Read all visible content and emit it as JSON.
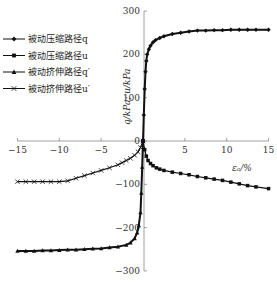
{
  "chart_data": {
    "type": "line",
    "title": "",
    "xlabel": "εₐ/%",
    "ylabel": "q/kPa; u/kPa",
    "xlim": [
      -15,
      15
    ],
    "ylim": [
      -300,
      300
    ],
    "xticks": [
      -15,
      -10,
      -5,
      0,
      5,
      10,
      15
    ],
    "yticks": [
      -300,
      -200,
      -100,
      0,
      100,
      200,
      300
    ],
    "grid": false,
    "legend_position": "upper-left",
    "series": [
      {
        "name": "被动压缩路径q",
        "marker": "diamond",
        "x": [
          0,
          0.1,
          0.2,
          0.3,
          0.4,
          0.5,
          0.7,
          0.9,
          1.2,
          1.5,
          2,
          2.5,
          3.5,
          4.5,
          5.5,
          6.5,
          7.5,
          8.5,
          9.5,
          10.5,
          11.5,
          12.5,
          13.5,
          15
        ],
        "y": [
          0,
          60,
          120,
          160,
          185,
          200,
          212,
          220,
          228,
          233,
          238,
          242,
          247,
          250,
          253,
          255,
          255,
          256,
          256,
          257,
          257,
          257,
          257,
          257
        ]
      },
      {
        "name": "被动压缩路径u",
        "marker": "square",
        "x": [
          0,
          0.2,
          0.4,
          0.6,
          0.9,
          1.2,
          1.6,
          2,
          2.5,
          3.5,
          4.5,
          5.5,
          6.5,
          7.5,
          8.5,
          9.5,
          10.5,
          11.5,
          12.5,
          13.5,
          15
        ],
        "y": [
          0,
          -20,
          -35,
          -45,
          -52,
          -57,
          -62,
          -65,
          -68,
          -72,
          -75,
          -78,
          -82,
          -85,
          -88,
          -91,
          -95,
          -99,
          -103,
          -106,
          -110
        ]
      },
      {
        "name": "被动挤伸路径q′",
        "marker": "triangle",
        "x": [
          0,
          -0.1,
          -0.2,
          -0.3,
          -0.5,
          -0.7,
          -1,
          -1.5,
          -2,
          -3,
          -4,
          -5,
          -6,
          -7,
          -8,
          -9,
          -10,
          -11,
          -12,
          -13,
          -14,
          -15
        ],
        "y": [
          0,
          -60,
          -120,
          -165,
          -195,
          -212,
          -225,
          -235,
          -240,
          -244,
          -246,
          -248,
          -249,
          -250,
          -251,
          -251,
          -252,
          -253,
          -253,
          -254,
          -254,
          -254
        ]
      },
      {
        "name": "被动挤伸路径u′",
        "marker": "x",
        "x": [
          0,
          -0.3,
          -0.6,
          -1,
          -1.5,
          -2,
          -2.5,
          -3,
          -4,
          -5,
          -6,
          -7,
          -8,
          -9,
          -10,
          -11,
          -12,
          -13,
          -14,
          -15
        ],
        "y": [
          0,
          -15,
          -25,
          -33,
          -40,
          -45,
          -50,
          -55,
          -62,
          -68,
          -74,
          -80,
          -86,
          -92,
          -94,
          -94,
          -94,
          -94,
          -94,
          -94
        ]
      }
    ]
  }
}
